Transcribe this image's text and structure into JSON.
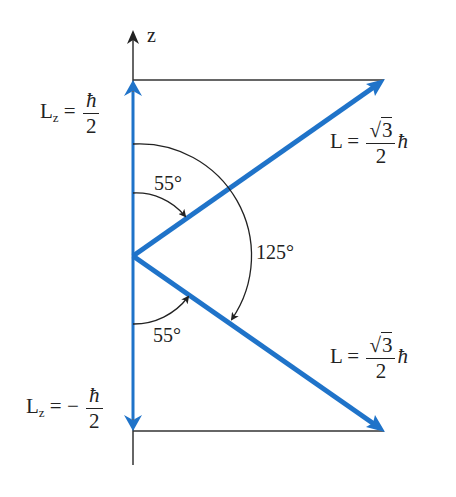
{
  "diagram": {
    "axis_label": "z",
    "lz_up": {
      "lhs": "L",
      "sub": "z",
      "eq": "=",
      "sign": "",
      "num": "ħ",
      "den": "2"
    },
    "lz_down": {
      "lhs": "L",
      "sub": "z",
      "eq": "=",
      "sign": "−",
      "num": "ħ",
      "den": "2"
    },
    "l_upper": {
      "lhs": "L",
      "eq": "=",
      "num_root": "√",
      "num_val": "3",
      "den": "2",
      "hbar": "ħ"
    },
    "l_lower": {
      "lhs": "L",
      "eq": "=",
      "num_root": "√",
      "num_val": "3",
      "den": "2",
      "hbar": "ħ"
    },
    "angle_upper": "55°",
    "angle_lower": "55°",
    "angle_between": "125°",
    "colors": {
      "vector": "#1f73c9",
      "line": "#333333"
    }
  }
}
